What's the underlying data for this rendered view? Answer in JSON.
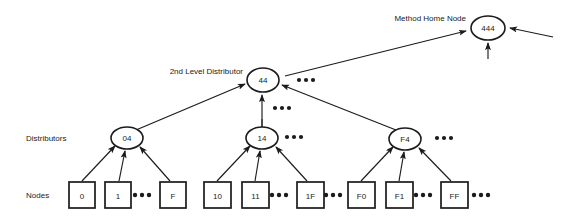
{
  "diagram": {
    "width": 561,
    "height": 219,
    "background_color": "#ffffff",
    "line_color": "#1b1b1b",
    "text_color": "#1b1b1b"
  },
  "labels": {
    "method_home_node": "Method Home Node",
    "second_level_distributor": "2nd Level Distributor",
    "distributors": "Distributors",
    "nodes": "Nodes"
  },
  "ellipsis": {
    "text": "•••"
  },
  "home_node": {
    "id": "home-node-444",
    "label": "444",
    "cx": 488,
    "cy": 28,
    "rx": 17,
    "ry": 12
  },
  "second_level": {
    "id": "second-level-node-44",
    "label": "44",
    "cx": 263,
    "cy": 80,
    "rx": 16,
    "ry": 12
  },
  "distributors": [
    {
      "id": "distributor-04",
      "label": "04",
      "cx": 127,
      "cy": 138,
      "rx": 16,
      "ry": 11
    },
    {
      "id": "distributor-14",
      "label": "14",
      "cx": 262,
      "cy": 138,
      "rx": 16,
      "ry": 11
    },
    {
      "id": "distributor-F4",
      "label": "F4",
      "cx": 405,
      "cy": 139,
      "rx": 16,
      "ry": 11
    }
  ],
  "nodes": [
    {
      "id": "node-0",
      "label": "0",
      "x": 69,
      "y": 182,
      "w": 26,
      "h": 26
    },
    {
      "id": "node-1",
      "label": "1",
      "x": 105,
      "y": 182,
      "w": 26,
      "h": 26
    },
    {
      "id": "node-F",
      "label": "F",
      "x": 160,
      "y": 182,
      "w": 26,
      "h": 26
    },
    {
      "id": "node-10",
      "label": "10",
      "x": 204,
      "y": 182,
      "w": 27,
      "h": 26
    },
    {
      "id": "node-11",
      "label": "11",
      "x": 242,
      "y": 182,
      "w": 27,
      "h": 26
    },
    {
      "id": "node-1F",
      "label": "1F",
      "x": 297,
      "y": 182,
      "w": 27,
      "h": 26
    },
    {
      "id": "node-F0",
      "label": "F0",
      "x": 348,
      "y": 182,
      "w": 27,
      "h": 26
    },
    {
      "id": "node-F1",
      "label": "F1",
      "x": 386,
      "y": 182,
      "w": 27,
      "h": 26
    },
    {
      "id": "node-FF",
      "label": "FF",
      "x": 441,
      "y": 182,
      "w": 27,
      "h": 26
    }
  ],
  "ellipsis_marks": [
    {
      "id": "ellipsis-44-right",
      "cx": 305,
      "cy": 80
    },
    {
      "id": "ellipsis-44-below",
      "cx": 281,
      "cy": 108
    },
    {
      "id": "ellipsis-14-right",
      "cx": 293,
      "cy": 137
    },
    {
      "id": "ellipsis-F4-right",
      "cx": 443,
      "cy": 138
    },
    {
      "id": "ellipsis-nodes-0-F",
      "cx": 141,
      "cy": 195
    },
    {
      "id": "ellipsis-nodes-11-1F",
      "cx": 278,
      "cy": 195
    },
    {
      "id": "ellipsis-nodes-1F-after",
      "cx": 332,
      "cy": 195
    },
    {
      "id": "ellipsis-nodes-F1-FF",
      "cx": 422,
      "cy": 195
    },
    {
      "id": "ellipsis-nodes-FF-after",
      "cx": 480,
      "cy": 195
    }
  ]
}
